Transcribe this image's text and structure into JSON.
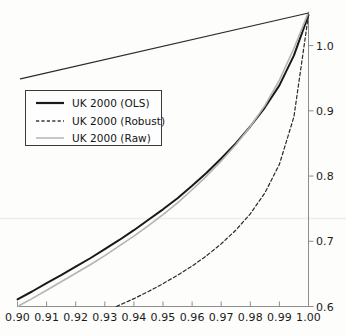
{
  "chart_data": {
    "type": "line",
    "title": "",
    "xlabel": "",
    "ylabel": "",
    "xlim": [
      0.9,
      1.0
    ],
    "ylim": [
      0.6,
      1.05
    ],
    "grid": false,
    "legend_position": "upper left",
    "xticks": [
      "0.90",
      "0.91",
      "0.92",
      "0.93",
      "0.94",
      "0.95",
      "0.96",
      "0.97",
      "0.98",
      "0.99",
      "1.00"
    ],
    "xtick_values": [
      0.9,
      0.91,
      0.92,
      0.93,
      0.94,
      0.95,
      0.96,
      0.97,
      0.98,
      0.99,
      1.0
    ],
    "yticks": [
      "0.6",
      "0.7",
      "0.8",
      "0.9",
      "1.0"
    ],
    "ytick_values": [
      0.6,
      0.7,
      0.8,
      0.9,
      1.0
    ],
    "yaxis_side": "right",
    "series": [
      {
        "name": "UK 2000 (OLS)",
        "style": "solid",
        "color": "#1a1a1a",
        "width": 2.0,
        "x": [
          0.9,
          0.905,
          0.91,
          0.915,
          0.92,
          0.925,
          0.93,
          0.935,
          0.94,
          0.945,
          0.95,
          0.955,
          0.96,
          0.965,
          0.97,
          0.975,
          0.98,
          0.985,
          0.99,
          0.995,
          1.0
        ],
        "y": [
          0.611,
          0.623,
          0.636,
          0.648,
          0.661,
          0.674,
          0.688,
          0.702,
          0.717,
          0.733,
          0.749,
          0.766,
          0.785,
          0.805,
          0.827,
          0.85,
          0.876,
          0.905,
          0.939,
          0.985,
          1.047
        ]
      },
      {
        "name": "UK 2000 (Robust)",
        "style": "dashed",
        "color": "#2a2a2a",
        "width": 1.2,
        "x": [
          0.934,
          0.94,
          0.945,
          0.95,
          0.955,
          0.96,
          0.965,
          0.97,
          0.975,
          0.98,
          0.985,
          0.99,
          0.995,
          1.0
        ],
        "y": [
          0.6,
          0.612,
          0.623,
          0.635,
          0.648,
          0.662,
          0.678,
          0.696,
          0.717,
          0.742,
          0.774,
          0.818,
          0.891,
          1.047
        ]
      },
      {
        "name": "UK 2000 (Raw)",
        "style": "solid",
        "color": "#b4b4b4",
        "width": 1.6,
        "x": [
          0.9,
          0.905,
          0.91,
          0.915,
          0.92,
          0.925,
          0.93,
          0.935,
          0.94,
          0.945,
          0.95,
          0.955,
          0.96,
          0.965,
          0.97,
          0.975,
          0.98,
          0.985,
          0.99,
          0.995,
          1.0
        ],
        "y": [
          0.6,
          0.612,
          0.625,
          0.638,
          0.651,
          0.664,
          0.678,
          0.693,
          0.708,
          0.724,
          0.741,
          0.759,
          0.779,
          0.8,
          0.823,
          0.848,
          0.876,
          0.908,
          0.947,
          0.996,
          1.051
        ]
      },
      {
        "name": "upper-envelope-line",
        "style": "solid",
        "color": "#2b2b2b",
        "width": 1.2,
        "x": [
          0.901,
          1.0
        ],
        "y": [
          0.949,
          1.05
        ]
      }
    ]
  },
  "legend": {
    "items": [
      {
        "label": "UK 2000 (OLS)",
        "style": "solid",
        "color": "#1a1a1a",
        "width": 2.2
      },
      {
        "label": "UK 2000 (Robust)",
        "style": "dashed",
        "color": "#3a3a3a",
        "width": 1.2
      },
      {
        "label": "UK 2000 (Raw)",
        "style": "solid",
        "color": "#b4b4b4",
        "width": 1.4
      }
    ]
  }
}
